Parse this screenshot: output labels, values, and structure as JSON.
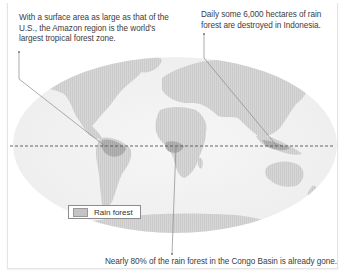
{
  "callouts": {
    "amazon": "With a surface area as large as that of the U.S., the Amazon region is the world's largest tropical forest zone.",
    "indonesia": "Daily some 6,000 hectares of rain forest are destroyed in Indonesia.",
    "congo": "Nearly 80% of the rain forest in the Congo Basin is already gone."
  },
  "legend": {
    "label": "Rain forest",
    "swatch_color": "#c4c4c4"
  },
  "map": {
    "equator_style": "dashed",
    "land_color": "#d9d9d9",
    "rainforest_color": "#b5b5b5",
    "ocean_color": "#f2f2f2"
  }
}
